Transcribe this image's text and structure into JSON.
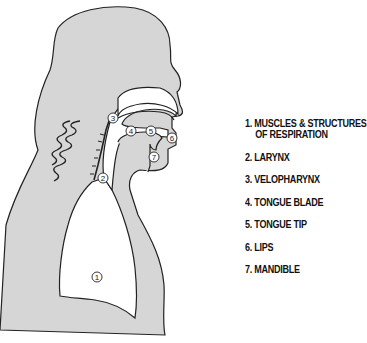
{
  "diagram": {
    "fill_color": "#d6d6d6",
    "outline_color": "#222222",
    "markers": [
      {
        "id": "1",
        "label": "1",
        "x": 97,
        "y": 277
      },
      {
        "id": "2",
        "label": "2",
        "x": 103,
        "y": 178
      },
      {
        "id": "3",
        "label": "3",
        "x": 113,
        "y": 118
      },
      {
        "id": "4",
        "label": "4",
        "x": 131,
        "y": 131
      },
      {
        "id": "5",
        "label": "5",
        "x": 151,
        "y": 131
      },
      {
        "id": "6",
        "label": "6",
        "x": 172,
        "y": 138
      },
      {
        "id": "7",
        "label": "7",
        "x": 154,
        "y": 157
      }
    ]
  },
  "legend": {
    "items": [
      {
        "num": "1.",
        "text": "MUSCLES & STRUCTURES",
        "text2": "OF RESPIRATION"
      },
      {
        "num": "2.",
        "text": "LARYNX"
      },
      {
        "num": "3.",
        "text": "VELOPHARYNX"
      },
      {
        "num": "4.",
        "text": "TONGUE BLADE"
      },
      {
        "num": "5.",
        "text": "TONGUE TIP"
      },
      {
        "num": "6.",
        "text": "LIPS"
      },
      {
        "num": "7.",
        "text": "MANDIBLE"
      }
    ]
  }
}
